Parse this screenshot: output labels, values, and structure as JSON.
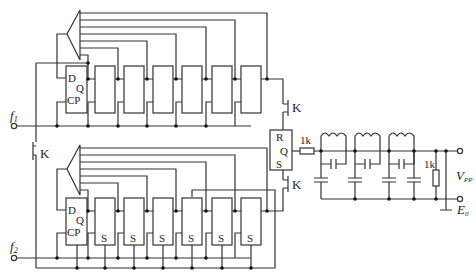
{
  "diagram": {
    "type": "circuit-schematic",
    "top_register": {
      "input_label": "f",
      "input_subscript": "1",
      "first_ff_pins": {
        "d": "D",
        "q": "Q",
        "cp": "CP"
      },
      "stage_count": 7,
      "switch_label": "K"
    },
    "bottom_register": {
      "input_label": "f",
      "input_subscript": "2",
      "first_ff_pins": {
        "d": "D",
        "q": "Q",
        "cp": "CP"
      },
      "stage_count": 7,
      "stage_labels": [
        "S",
        "S",
        "S",
        "S",
        "S",
        "S"
      ],
      "switch_label": "K"
    },
    "left_switch_label": "K",
    "rs_flipflop": {
      "r": "R",
      "q": "Q",
      "s": "S"
    },
    "output_filter": {
      "series_resistor": "1k",
      "load_resistor": "1k",
      "lc_sections": 3,
      "output_label": "V",
      "output_subscript": "PP",
      "ground_label": "E",
      "ground_subscript": "0"
    }
  }
}
